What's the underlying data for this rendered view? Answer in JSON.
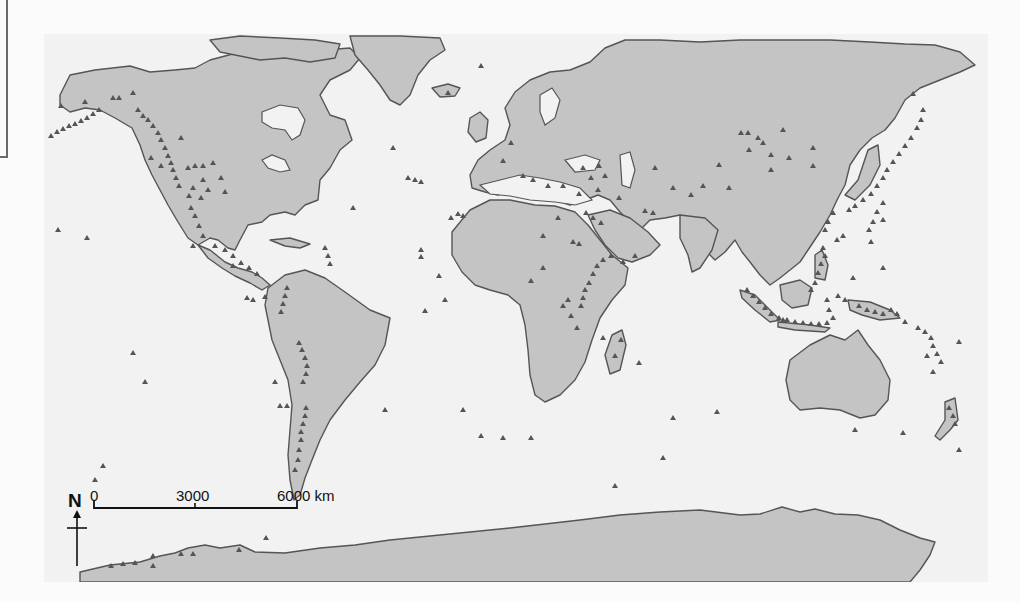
{
  "map": {
    "title": "",
    "subject": "World distribution of active volcanoes",
    "colors": {
      "land": "#c4c4c4",
      "ocean": "#f2f2f2",
      "coastline": "#555555",
      "volcano_marker": "#555555"
    },
    "marker_icon": "triangle",
    "scale_bar": {
      "ticks": [
        "0",
        "3000",
        "6000 km"
      ],
      "unit": "km"
    },
    "north_arrow": {
      "label": "N"
    },
    "regions_with_volcano_clusters": [
      "Aleutian Islands",
      "Alaska",
      "Cascades",
      "Mexico",
      "Central America",
      "Lesser Antilles",
      "Andes",
      "Iceland",
      "Mediterranean",
      "East African Rift",
      "Arabia",
      "Kamchatka",
      "Kuril Islands",
      "Japan",
      "Philippines",
      "Indonesia",
      "Papua New Guinea",
      "Vanuatu",
      "New Zealand",
      "Antarctica"
    ]
  }
}
